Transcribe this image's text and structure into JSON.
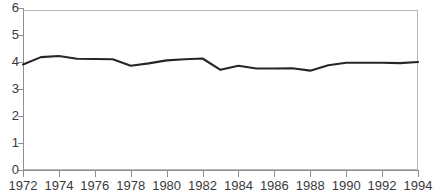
{
  "chart_data": {
    "type": "line",
    "title": "",
    "xlabel": "",
    "ylabel": "",
    "xlim": [
      1972,
      1994
    ],
    "ylim": [
      0,
      6
    ],
    "grid": false,
    "legend": null,
    "series": [
      {
        "name": "series-1",
        "color": "#262626",
        "x": [
          1972,
          1973,
          1974,
          1975,
          1976,
          1977,
          1978,
          1979,
          1980,
          1981,
          1982,
          1983,
          1984,
          1985,
          1986,
          1987,
          1988,
          1989,
          1990,
          1991,
          1992,
          1993,
          1994
        ],
        "values": [
          3.91,
          4.18,
          4.22,
          4.12,
          4.11,
          4.1,
          3.86,
          3.95,
          4.06,
          4.1,
          4.13,
          3.71,
          3.86,
          3.76,
          3.76,
          3.77,
          3.68,
          3.88,
          3.97,
          3.97,
          3.97,
          3.96,
          4.0
        ]
      }
    ],
    "y_ticks": [
      0,
      1,
      2,
      3,
      4,
      5,
      6
    ],
    "y_tick_labels": [
      "0",
      "1",
      "2",
      "3",
      "4",
      "5",
      "6"
    ],
    "x_ticks": [
      1972,
      1974,
      1976,
      1978,
      1980,
      1982,
      1984,
      1986,
      1988,
      1990,
      1992,
      1994
    ],
    "x_tick_labels": [
      "1972",
      "1974",
      "1976",
      "1978",
      "1980",
      "1982",
      "1984",
      "1986",
      "1988",
      "1990",
      "1992",
      "1994"
    ]
  },
  "axes": {
    "y_labels": [
      "6",
      "5",
      "4",
      "3",
      "2",
      "1",
      "0"
    ],
    "x_labels": [
      "1972",
      "1974",
      "1976",
      "1978",
      "1980",
      "1982",
      "1984",
      "1986",
      "1988",
      "1990",
      "1992",
      "1994"
    ]
  },
  "colors": {
    "line": "#262626",
    "axis": "#8e8e93",
    "frame": "#b6b6bb",
    "text": "#3a3a3c",
    "background": "#ffffff"
  }
}
